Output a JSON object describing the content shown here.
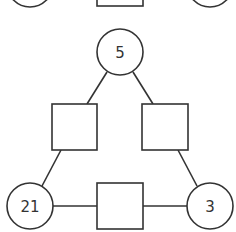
{
  "diagram": {
    "type": "number-triangle-puzzle",
    "stroke_color": "#333333",
    "fill_color": "#ffffff",
    "text_color": "#333333",
    "partial_top_row": {
      "left_circle": {
        "cx": 30,
        "cy": -16,
        "r": 23,
        "label": ""
      },
      "middle_square": {
        "x": 97,
        "y": -40,
        "w": 46,
        "h": 46,
        "label": ""
      },
      "right_circle": {
        "cx": 210,
        "cy": -16,
        "r": 23,
        "label": ""
      }
    },
    "nodes": {
      "top_circle": {
        "cx": 120,
        "cy": 52,
        "r": 23,
        "label": "5"
      },
      "left_square": {
        "x": 52,
        "y": 104,
        "w": 45,
        "h": 46,
        "label": ""
      },
      "right_square": {
        "x": 142,
        "y": 104,
        "w": 46,
        "h": 46,
        "label": ""
      },
      "bottom_left_circle": {
        "cx": 30,
        "cy": 206,
        "r": 23,
        "label": "21"
      },
      "bottom_square": {
        "x": 97,
        "y": 183,
        "w": 46,
        "h": 46,
        "label": ""
      },
      "bottom_right_circle": {
        "cx": 210,
        "cy": 206,
        "r": 23,
        "label": "3"
      }
    },
    "edges": [
      {
        "from": "top_circle",
        "to": "left_square",
        "x1": 107,
        "y1": 72,
        "x2": 87,
        "y2": 104
      },
      {
        "from": "top_circle",
        "to": "right_square",
        "x1": 133,
        "y1": 72,
        "x2": 153,
        "y2": 104
      },
      {
        "from": "left_square",
        "to": "bottom_left_circle",
        "x1": 61,
        "y1": 150,
        "x2": 42,
        "y2": 186
      },
      {
        "from": "right_square",
        "to": "bottom_right_circle",
        "x1": 178,
        "y1": 150,
        "x2": 197,
        "y2": 186
      },
      {
        "from": "bottom_left_circle",
        "to": "bottom_square",
        "x1": 53,
        "y1": 206,
        "x2": 97,
        "y2": 206
      },
      {
        "from": "bottom_square",
        "to": "bottom_right_circle",
        "x1": 143,
        "y1": 206,
        "x2": 187,
        "y2": 206
      }
    ]
  }
}
